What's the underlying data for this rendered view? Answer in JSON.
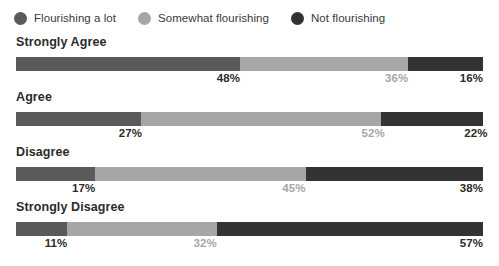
{
  "legend": {
    "items": [
      {
        "label": "Flourishing a lot",
        "color": "#5a5a5a",
        "icon": "legend-dot-icon"
      },
      {
        "label": "Somewhat flourishing",
        "color": "#a6a6a6",
        "icon": "legend-dot-icon"
      },
      {
        "label": "Not flourishing",
        "color": "#333333",
        "icon": "legend-dot-icon"
      }
    ]
  },
  "chart_data": {
    "type": "bar",
    "title": "",
    "subtitle": "",
    "xlabel": "",
    "ylabel": "",
    "orientation": "horizontal",
    "stacked": true,
    "stack_total": 100,
    "units": "%",
    "grid": false,
    "legend_position": "top-left",
    "xlim": [
      0,
      100
    ],
    "categories": [
      "Strongly Agree",
      "Agree",
      "Disagree",
      "Strongly Disagree"
    ],
    "series": [
      {
        "name": "Flourishing a lot",
        "color": "#5a5a5a",
        "values": [
          48,
          27,
          17,
          11
        ]
      },
      {
        "name": "Somewhat flourishing",
        "color": "#a6a6a6",
        "values": [
          36,
          52,
          45,
          32
        ]
      },
      {
        "name": "Not flourishing",
        "color": "#333333",
        "values": [
          16,
          22,
          38,
          57
        ]
      }
    ],
    "data_labels": [
      [
        "48%",
        "36%",
        "16%"
      ],
      [
        "27%",
        "52%",
        "22%"
      ],
      [
        "17%",
        "45%",
        "38%"
      ],
      [
        "11%",
        "32%",
        "57%"
      ]
    ]
  }
}
